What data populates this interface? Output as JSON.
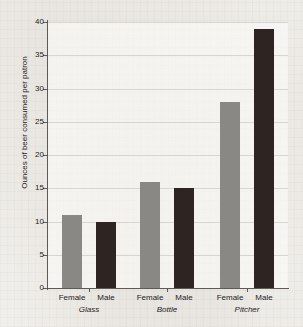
{
  "chart_data": {
    "type": "bar",
    "title": "",
    "xlabel": "",
    "ylabel": "Ounces of beer consumed per patron",
    "ylim": [
      0,
      40
    ],
    "ytick_labels": [
      "40",
      "35",
      "30",
      "25",
      "20",
      "15",
      "10",
      "5",
      "0"
    ],
    "ytick_values": [
      40,
      35,
      30,
      25,
      20,
      15,
      10,
      5,
      0
    ],
    "grid": "horizontal",
    "legend": "none",
    "categories": [
      "Glass",
      "Bottle",
      "Pitcher"
    ],
    "subcategories": [
      "Female",
      "Male"
    ],
    "series": [
      {
        "name": "Female",
        "color": "#8a8885",
        "values": [
          11,
          16,
          28
        ]
      },
      {
        "name": "Male",
        "color": "#2e2522",
        "values": [
          10,
          15,
          39
        ]
      }
    ],
    "bars": [
      {
        "group": "Glass",
        "subcategory": "Female",
        "value": 11
      },
      {
        "group": "Glass",
        "subcategory": "Male",
        "value": 10
      },
      {
        "group": "Bottle",
        "subcategory": "Female",
        "value": 16
      },
      {
        "group": "Bottle",
        "subcategory": "Male",
        "value": 15
      },
      {
        "group": "Pitcher",
        "subcategory": "Female",
        "value": 28
      },
      {
        "group": "Pitcher",
        "subcategory": "Male",
        "value": 39
      }
    ]
  },
  "colors": {
    "female_bar": "#8a8885",
    "male_bar": "#2e2522",
    "axis": "#5d5a55",
    "gridline": "#d8d6d2",
    "background": "#f3f1ed",
    "text": "#25211e"
  }
}
